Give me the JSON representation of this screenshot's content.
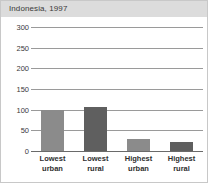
{
  "card": {
    "title": "Indonesia, 1997"
  },
  "chart_data": {
    "type": "bar",
    "title": "Indonesia, 1997",
    "xlabel": "",
    "ylabel": "",
    "categories": [
      "Lowest urban",
      "Lowest rural",
      "Highest urban",
      "Highest rural"
    ],
    "category_lines": [
      [
        "Lowest",
        "urban"
      ],
      [
        "Lowest",
        "rural"
      ],
      [
        "Highest",
        "urban"
      ],
      [
        "Highest",
        "rural"
      ]
    ],
    "values": [
      100,
      107,
      28,
      23
    ],
    "ylim": [
      0,
      300
    ],
    "yticks": [
      0,
      50,
      100,
      150,
      200,
      250,
      300
    ],
    "ytick_labels": [
      "0",
      "50",
      "100",
      "150",
      "200",
      "250",
      "300"
    ],
    "grid": true,
    "legend": "none",
    "bar_colors": [
      "#8b8b8b",
      "#5f5f5f",
      "#8b8b8b",
      "#5f5f5f"
    ]
  },
  "colors": {
    "title_bar_background": "#dcdcdc",
    "title_text": "#3a3a3a",
    "gridline": "#9a9a9a",
    "axis": "#6a6a6a",
    "card_border": "#c8c8c8",
    "plot_background": "#ffffff"
  }
}
